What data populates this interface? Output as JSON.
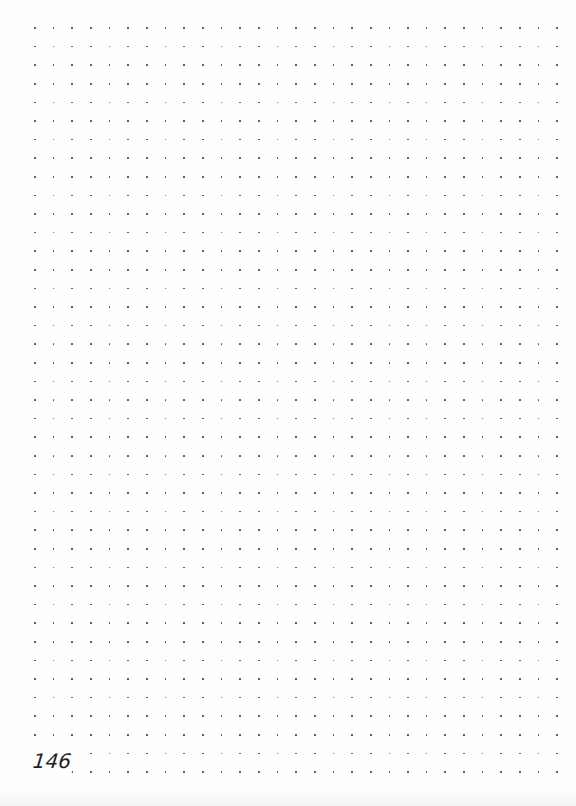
{
  "page": {
    "type": "dot-grid notebook page",
    "background_color": "#fefefe",
    "page_number": "146"
  },
  "grid": {
    "columns": 29,
    "rows": 41,
    "origin_x": 35,
    "origin_y": 28,
    "pitch_x": 18.65,
    "pitch_y": 18.6,
    "dot_color": "#4a4a4a",
    "dot_size": 1.7
  }
}
